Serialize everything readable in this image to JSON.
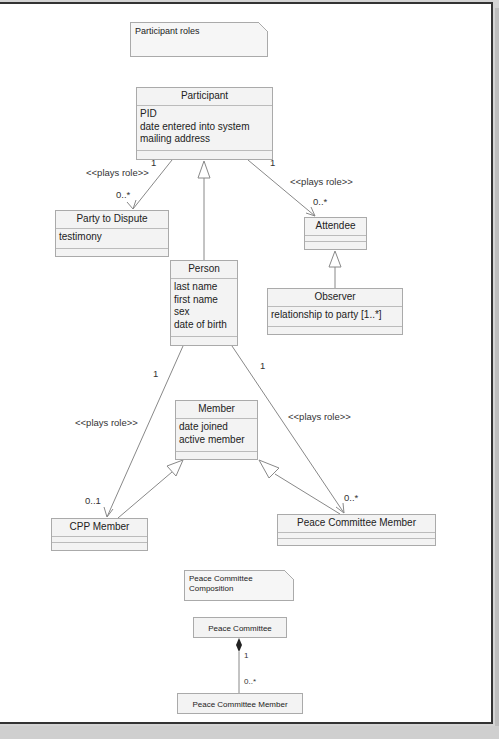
{
  "notes": {
    "participant_roles": "Participant roles",
    "composition_line1": "Peace Committee",
    "composition_line2": "Composition"
  },
  "classes": {
    "participant": {
      "name": "Participant",
      "attrs": [
        "PID",
        "date entered into system",
        "mailing address"
      ]
    },
    "party_to_dispute": {
      "name": "Party to Dispute",
      "attrs": [
        "testimony"
      ]
    },
    "attendee": {
      "name": "Attendee",
      "attrs": []
    },
    "observer": {
      "name": "Observer",
      "attrs": [
        "relationship to party [1..*]"
      ]
    },
    "person": {
      "name": "Person",
      "attrs": [
        "last name",
        "first name",
        "sex",
        "date of birth"
      ]
    },
    "member": {
      "name": "Member",
      "attrs": [
        "date joined",
        "active member"
      ]
    },
    "cpp_member": {
      "name": "CPP Member",
      "attrs": []
    },
    "peace_committee_member": {
      "name": "Peace Committee Member",
      "attrs": []
    },
    "peace_committee": {
      "name": "Peace Committee"
    },
    "peace_committee_member_2": {
      "name": "Peace Committee Member"
    }
  },
  "associations": {
    "participant_party": {
      "stereotype": "<<plays role>>",
      "source_mult": "1",
      "target_mult": "0..*"
    },
    "participant_attendee": {
      "stereotype": "<<plays role>>",
      "source_mult": "1",
      "target_mult": "0..*"
    },
    "person_cpp": {
      "stereotype": "<<plays role>>",
      "source_mult": "1",
      "target_mult": "0..1"
    },
    "person_pcm": {
      "stereotype": "<<plays role>>",
      "source_mult": "1",
      "target_mult": "0..*"
    },
    "composition": {
      "source_mult": "1",
      "target_mult": "0..*"
    }
  }
}
